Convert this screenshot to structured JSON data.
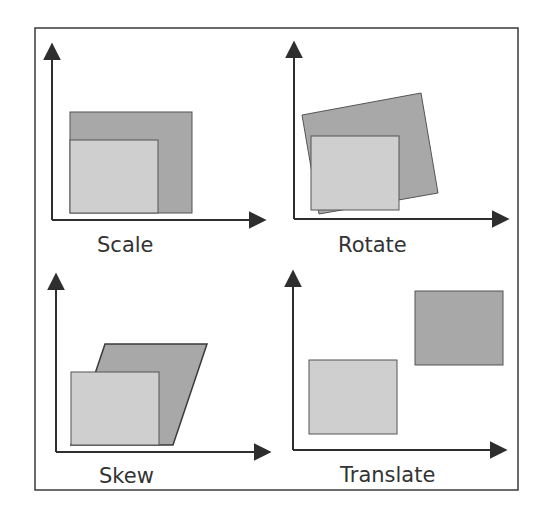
{
  "colors": {
    "frame": "#3a3a3a",
    "axis": "#2e2e2e",
    "original_fill": "#cfcfcf",
    "transformed_fill": "#a8a8a8",
    "shape_stroke": "#555555",
    "label": "#333333"
  },
  "panels": [
    {
      "id": "scale",
      "label": "Scale"
    },
    {
      "id": "rotate",
      "label": "Rotate"
    },
    {
      "id": "skew",
      "label": "Skew"
    },
    {
      "id": "translate",
      "label": "Translate"
    }
  ]
}
